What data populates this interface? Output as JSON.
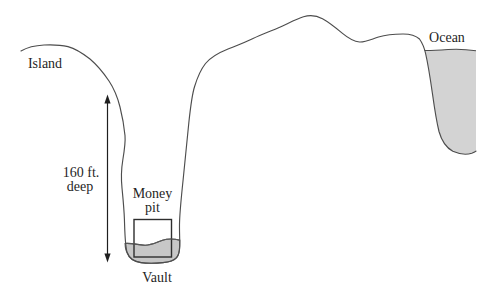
{
  "figure": {
    "labels": {
      "island": "Island",
      "ocean": "Ocean",
      "depth_line1": "160 ft.",
      "depth_line2": "deep",
      "money_pit_line1": "Money",
      "money_pit_line2": "pit",
      "vault": "Vault"
    },
    "colors": {
      "background": "#ffffff",
      "terrain_line": "#4d4d4d",
      "ocean_fill": "#d3d3d3",
      "pit_water_fill": "#c7c7c7",
      "pit_water_line": "#585858",
      "vault_outline": "#2e2e2e",
      "arrow": "#1f1f1f",
      "text": "#1f1f1f"
    }
  }
}
